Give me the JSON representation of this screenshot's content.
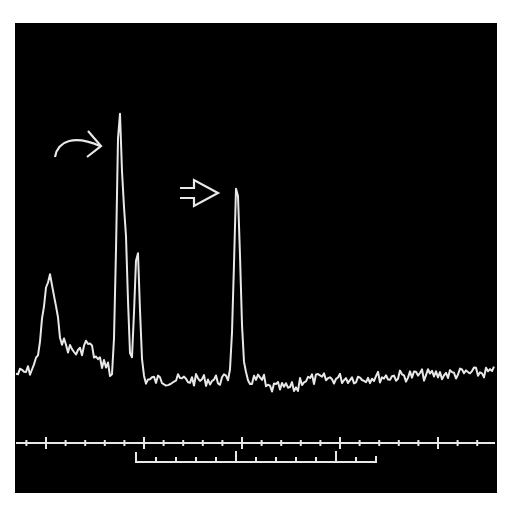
{
  "chart_data": {
    "type": "line",
    "title": "",
    "xlabel": "",
    "ylabel": "",
    "background": "#000000",
    "trace_color": "#e8e8e8",
    "grid": false,
    "legend": null,
    "annotations": [
      {
        "type": "curved-arrow",
        "target": "tallest peak",
        "x_px": 118,
        "y_px": 122
      },
      {
        "type": "hollow-arrow",
        "target": "isolated right peak",
        "x_px": 237,
        "y_px": 174
      }
    ],
    "axis": {
      "major_ticks_px": [
        46,
        144,
        242,
        340,
        438
      ],
      "minor_tick_spacing_px": 19.6,
      "tick_labels": []
    },
    "scale_bar": {
      "x_start_px": 136,
      "x_end_px": 376,
      "major_ticks_px": [
        236,
        335
      ],
      "minor_tick_spacing_px": 20
    },
    "peaks": [
      {
        "name": "left broad peak",
        "x_px": 49,
        "relative_height": 0.3
      },
      {
        "name": "tallest peak (curved arrow)",
        "x_px": 119,
        "relative_height": 1.0
      },
      {
        "name": "shoulder peak",
        "x_px": 125,
        "relative_height": 0.55
      },
      {
        "name": "third peak",
        "x_px": 137,
        "relative_height": 0.52
      },
      {
        "name": "isolated peak (hollow arrow)",
        "x_px": 237,
        "relative_height": 0.77
      }
    ]
  }
}
